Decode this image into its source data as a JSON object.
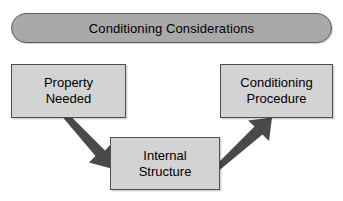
{
  "diagram": {
    "title": "Conditioning Considerations",
    "banner": {
      "label": "Conditioning Considerations",
      "fill": "#a9a9a9",
      "stroke": "#5e5e5e",
      "shape": "rounded-rectangle"
    },
    "node_fill": "#d3d3d3",
    "node_stroke": "#4e4e4e",
    "arrow_color": "#4a4a4a",
    "background": "#ffffff",
    "nodes": [
      {
        "id": "property-needed",
        "lines": [
          "Property",
          "Needed"
        ]
      },
      {
        "id": "internal-structure",
        "lines": [
          "Internal",
          "Structure"
        ]
      },
      {
        "id": "conditioning-procedure",
        "lines": [
          "Conditioning",
          "Procedure"
        ]
      }
    ],
    "arrows": [
      {
        "id": "property-to-internal",
        "from": "property-needed",
        "to": "internal-structure",
        "direction": "down-right"
      },
      {
        "id": "internal-to-procedure",
        "from": "internal-structure",
        "to": "conditioning-procedure",
        "direction": "up-right"
      }
    ]
  }
}
